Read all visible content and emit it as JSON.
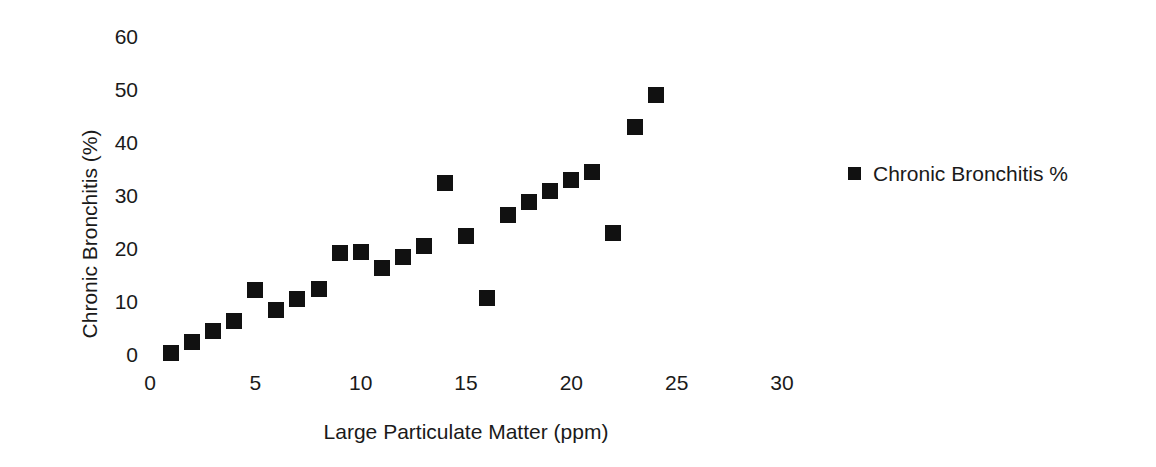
{
  "chart_data": {
    "type": "scatter",
    "title": "",
    "xlabel": "Large Particulate Matter (ppm)",
    "ylabel": "Chronic Bronchitis (%)",
    "xlim": [
      0,
      30
    ],
    "ylim": [
      0,
      60
    ],
    "xticks": [
      "0",
      "5",
      "10",
      "15",
      "20",
      "25",
      "30"
    ],
    "yticks": [
      "0",
      "10",
      "20",
      "30",
      "40",
      "50",
      "60"
    ],
    "xtick_values": [
      0,
      5,
      10,
      15,
      20,
      25,
      30
    ],
    "ytick_values": [
      0,
      10,
      20,
      30,
      40,
      50,
      60
    ],
    "grid": false,
    "legend_position": "right",
    "marker": "square",
    "marker_color": "#111111",
    "series": [
      {
        "name": "Chronic Bronchitis %",
        "points": [
          [
            1,
            0.3
          ],
          [
            2,
            2.4
          ],
          [
            3,
            4.5
          ],
          [
            4,
            6.5
          ],
          [
            5,
            12.2
          ],
          [
            6,
            8.5
          ],
          [
            7,
            10.5
          ],
          [
            8,
            12.5
          ],
          [
            9,
            19.3
          ],
          [
            10,
            19.5
          ],
          [
            11,
            16.5
          ],
          [
            12,
            18.5
          ],
          [
            13,
            20.5
          ],
          [
            14,
            32.5
          ],
          [
            15,
            22.5
          ],
          [
            16,
            10.7
          ],
          [
            17,
            26.5
          ],
          [
            18,
            28.8
          ],
          [
            19,
            31.0
          ],
          [
            20,
            33.0
          ],
          [
            21,
            34.5
          ],
          [
            22,
            23.0
          ],
          [
            23,
            43.0
          ],
          [
            24,
            49.0
          ]
        ]
      }
    ]
  },
  "legend": {
    "entries": [
      {
        "label": "Chronic Bronchitis %",
        "color": "#111111",
        "marker": "square-marker"
      }
    ]
  }
}
